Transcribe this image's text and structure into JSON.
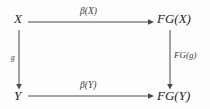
{
  "diagram": {
    "type": "commutative-square",
    "background_color": "#fdfdfd",
    "stroke_color": "#4a4a4a",
    "text_color": "#262626",
    "nodes": [
      {
        "id": "top-left",
        "label": "X",
        "x": 14,
        "y": 18
      },
      {
        "id": "top-right",
        "label": "FG(X)",
        "x": 178,
        "y": 18
      },
      {
        "id": "bottom-left",
        "label": "Y",
        "x": 14,
        "y": 96
      },
      {
        "id": "bottom-right",
        "label": "FG(Y)",
        "x": 178,
        "y": 96
      }
    ],
    "edges": [
      {
        "id": "top",
        "from": "top-left",
        "to": "top-right",
        "label": "β(X)",
        "direction": "right"
      },
      {
        "id": "left",
        "from": "top-left",
        "to": "bottom-left",
        "label": "g",
        "direction": "down"
      },
      {
        "id": "right",
        "from": "top-right",
        "to": "bottom-right",
        "label": "FG(g)",
        "direction": "down"
      },
      {
        "id": "bottom",
        "from": "bottom-left",
        "to": "bottom-right",
        "label": "β(Y)",
        "direction": "right"
      }
    ]
  }
}
